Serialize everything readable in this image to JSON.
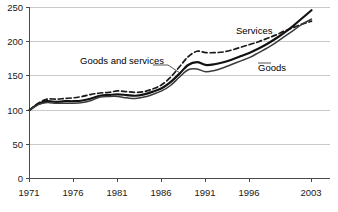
{
  "chart_data": {
    "type": "line",
    "title": "",
    "subtitle": "",
    "xlabel": "",
    "ylabel": "",
    "xlim": [
      1971,
      2003
    ],
    "ylim": [
      0,
      250
    ],
    "grid": true,
    "legend_position": "inline-annotations",
    "x_ticks": [
      "1971",
      "1976",
      "1981",
      "1986",
      "1991",
      "1996",
      "2003"
    ],
    "x_tick_values": [
      1971,
      1976,
      1981,
      1986,
      1991,
      1996,
      2003
    ],
    "y_ticks": [
      "0",
      "50",
      "100",
      "150",
      "200",
      "250"
    ],
    "y_tick_values": [
      0,
      50,
      100,
      150,
      200,
      250
    ],
    "x": [
      1971,
      1972,
      1973,
      1974,
      1975,
      1976,
      1977,
      1978,
      1979,
      1980,
      1981,
      1982,
      1983,
      1984,
      1985,
      1986,
      1987,
      1988,
      1989,
      1990,
      1991,
      1992,
      1993,
      1994,
      1995,
      1996,
      1997,
      1998,
      1999,
      2000,
      2001,
      2002,
      2003
    ],
    "series": [
      {
        "name": "Services",
        "style": "dashed",
        "color": "#1a1a1a",
        "values": [
          100,
          110,
          116,
          116,
          117,
          118,
          120,
          123,
          125,
          126,
          128,
          127,
          126,
          127,
          131,
          137,
          148,
          163,
          178,
          186,
          184,
          184,
          185,
          188,
          192,
          196,
          200,
          205,
          210,
          216,
          221,
          226,
          230
        ]
      },
      {
        "name": "Goods and services",
        "style": "solid",
        "color": "#111111",
        "values": [
          100,
          109,
          113,
          112,
          113,
          113,
          114,
          117,
          121,
          122,
          123,
          122,
          121,
          123,
          127,
          132,
          141,
          153,
          166,
          170,
          166,
          167,
          170,
          174,
          179,
          184,
          190,
          197,
          205,
          214,
          224,
          235,
          246
        ]
      },
      {
        "name": "Goods",
        "style": "solid",
        "color": "#3a3a3a",
        "values": [
          100,
          108,
          111,
          110,
          110,
          110,
          111,
          114,
          119,
          120,
          120,
          118,
          117,
          119,
          123,
          128,
          136,
          148,
          159,
          160,
          156,
          158,
          162,
          167,
          172,
          177,
          184,
          191,
          199,
          208,
          217,
          226,
          233
        ]
      }
    ],
    "annotations": [
      {
        "text": "Services",
        "series": "Services"
      },
      {
        "text": "Goods and services",
        "series": "Goods and services"
      },
      {
        "text": "Goods",
        "series": "Goods"
      }
    ]
  }
}
